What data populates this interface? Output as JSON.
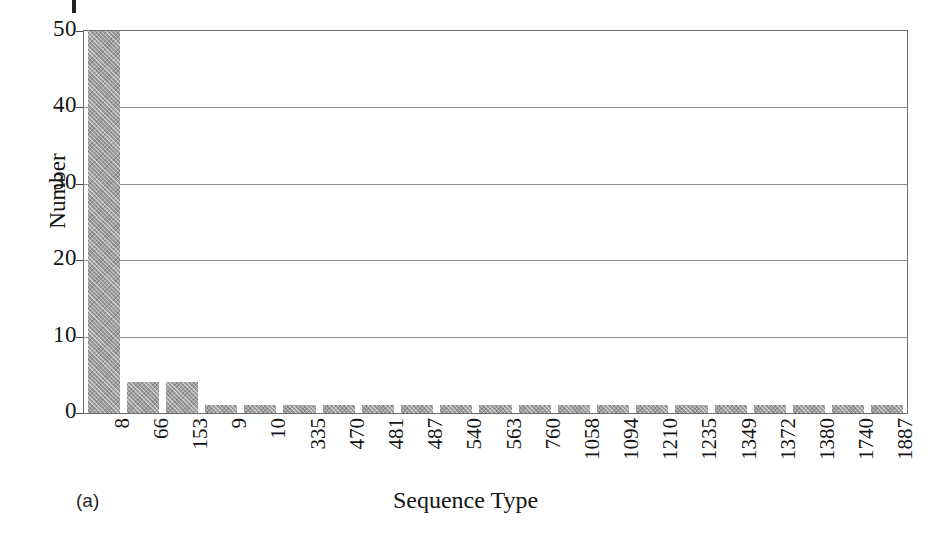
{
  "figure": {
    "panel_caption": "(a)",
    "background_color": "#ffffff",
    "bar_color": "#a0a0a0",
    "axis_color": "#6b6b6b",
    "gridline_color": "#8d8d8d"
  },
  "chart_data": {
    "type": "bar",
    "title": "",
    "subtitle": "",
    "xlabel": "Sequence Type",
    "ylabel": "Number",
    "ylim": [
      0,
      50
    ],
    "yticks": [
      0,
      10,
      20,
      30,
      40,
      50
    ],
    "ytick_labels": [
      "0",
      "10",
      "20",
      "30",
      "40",
      "50"
    ],
    "grid": true,
    "grid_axis": "y",
    "legend": false,
    "legend_position": "none",
    "categories": [
      "8",
      "66",
      "153",
      "9",
      "10",
      "335",
      "470",
      "481",
      "487",
      "540",
      "563",
      "760",
      "1058",
      "1094",
      "1210",
      "1235",
      "1349",
      "1372",
      "1380",
      "1740",
      "1887"
    ],
    "values": [
      50,
      4,
      4,
      1,
      1,
      1,
      1,
      1,
      1,
      1,
      1,
      1,
      1,
      1,
      1,
      1,
      1,
      1,
      1,
      1,
      1
    ],
    "annotations": [
      {
        "text": "(a)",
        "role": "panel-label"
      }
    ]
  }
}
